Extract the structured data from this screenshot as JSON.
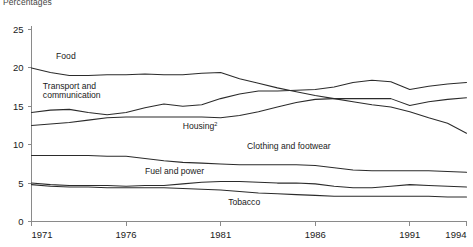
{
  "chart_data": {
    "type": "line",
    "title": "",
    "unit_note": "Percentages",
    "xlabel": "",
    "ylabel": "",
    "xlim": [
      1971,
      1994
    ],
    "ylim": [
      0,
      25
    ],
    "x_ticks": [
      "1971",
      "1976",
      "1981",
      "1986",
      "1991",
      "1994"
    ],
    "x_tick_values": [
      1971,
      1976,
      1981,
      1986,
      1991,
      1994
    ],
    "y_ticks": [
      "0",
      "5",
      "10",
      "15",
      "20",
      "25"
    ],
    "y_tick_values": [
      0,
      5,
      10,
      15,
      20,
      25
    ],
    "grid": false,
    "legend_position": "inline-labels",
    "x": [
      1971,
      1972,
      1973,
      1974,
      1975,
      1976,
      1977,
      1978,
      1979,
      1980,
      1981,
      1982,
      1983,
      1984,
      1985,
      1986,
      1987,
      1988,
      1989,
      1990,
      1991,
      1992,
      1993,
      1994
    ],
    "series": [
      {
        "name": "Food",
        "label": "Food",
        "label_sup": "",
        "values": [
          20.0,
          19.4,
          19.0,
          19.0,
          19.1,
          19.1,
          19.2,
          19.1,
          19.1,
          19.3,
          19.4,
          18.6,
          18.0,
          17.4,
          16.9,
          16.4,
          16.0,
          15.6,
          15.2,
          14.9,
          14.3,
          13.5,
          12.8,
          11.5
        ]
      },
      {
        "name": "Transport and communication",
        "label": "Transport and communication",
        "label_sup": "",
        "values": [
          14.2,
          14.5,
          14.6,
          14.2,
          13.9,
          14.2,
          14.8,
          15.3,
          15.0,
          15.2,
          16.0,
          16.6,
          17.0,
          17.0,
          17.1,
          17.2,
          17.5,
          18.1,
          18.4,
          18.2,
          17.2,
          17.6,
          17.9,
          18.1
        ]
      },
      {
        "name": "Housing",
        "label": "Housing",
        "label_sup": "2",
        "values": [
          12.5,
          12.7,
          12.9,
          13.2,
          13.5,
          13.6,
          13.6,
          13.6,
          13.6,
          13.6,
          13.5,
          13.8,
          14.3,
          14.9,
          15.5,
          15.9,
          16.0,
          16.0,
          16.0,
          16.0,
          15.1,
          15.6,
          15.9,
          16.1
        ]
      },
      {
        "name": "Clothing and footwear",
        "label": "Clothing and footwear",
        "label_sup": "",
        "values": [
          8.6,
          8.6,
          8.6,
          8.6,
          8.5,
          8.5,
          8.2,
          7.9,
          7.7,
          7.6,
          7.5,
          7.4,
          7.4,
          7.4,
          7.4,
          7.3,
          7.0,
          6.7,
          6.6,
          6.6,
          6.6,
          6.6,
          6.5,
          6.4
        ]
      },
      {
        "name": "Fuel and power",
        "label": "Fuel and power",
        "label_sup": "",
        "values": [
          5.0,
          4.8,
          4.7,
          4.7,
          4.7,
          4.6,
          4.7,
          4.7,
          4.9,
          5.1,
          5.2,
          5.2,
          5.1,
          5.0,
          5.0,
          4.9,
          4.6,
          4.4,
          4.4,
          4.6,
          4.8,
          4.7,
          4.6,
          4.5
        ]
      },
      {
        "name": "Tobacco",
        "label": "Tobacco",
        "label_sup": "",
        "values": [
          4.8,
          4.6,
          4.5,
          4.5,
          4.4,
          4.4,
          4.4,
          4.4,
          4.3,
          4.2,
          4.1,
          3.9,
          3.7,
          3.6,
          3.5,
          3.4,
          3.3,
          3.3,
          3.3,
          3.3,
          3.3,
          3.3,
          3.2,
          3.2
        ]
      }
    ],
    "annotations": [
      {
        "text": "Food",
        "sup": "",
        "x": 1972.3,
        "y": 21.2
      },
      {
        "text": "Transport and",
        "sup": "",
        "x": 1971.6,
        "y": 17.3
      },
      {
        "text": "communication",
        "sup": "",
        "x": 1971.6,
        "y": 16.1
      },
      {
        "text": "Housing",
        "sup": "2",
        "x": 1979.0,
        "y": 12.1
      },
      {
        "text": "Clothing and footwear",
        "sup": "",
        "x": 1982.4,
        "y": 9.4
      },
      {
        "text": "Fuel and power",
        "sup": "",
        "x": 1977.0,
        "y": 6.2
      },
      {
        "text": "Tobacco",
        "sup": "",
        "x": 1981.4,
        "y": 2.1
      }
    ]
  }
}
